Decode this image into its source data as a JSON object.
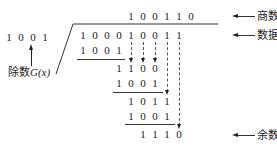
{
  "diagram": {
    "type": "crc-polynomial-division",
    "divisor": {
      "digits": [
        "1",
        "0",
        "0",
        "1"
      ],
      "label": "除数",
      "label_func": "G(x)"
    },
    "quotient": {
      "digits": [
        "1",
        "0",
        "0",
        "1",
        "1",
        "0"
      ],
      "label": "商数"
    },
    "dividend": {
      "digits": [
        "1",
        "0",
        "0",
        "0",
        "1",
        "0",
        "0",
        "1",
        "1"
      ],
      "label": "数据序列"
    },
    "steps": [
      {
        "row": [
          "1",
          "0",
          "0",
          "1"
        ]
      },
      {
        "row": [
          "1",
          "1",
          "0",
          "0"
        ]
      },
      {
        "row": [
          "1",
          "0",
          "0",
          "1"
        ]
      },
      {
        "row": [
          "1",
          "0",
          "1",
          "1"
        ]
      },
      {
        "row": [
          "1",
          "0",
          "0",
          "1"
        ]
      },
      {
        "row": [
          "1",
          "1",
          "1",
          "0"
        ]
      }
    ],
    "remainder": {
      "label": "余数",
      "label_func": "R(x)"
    }
  }
}
